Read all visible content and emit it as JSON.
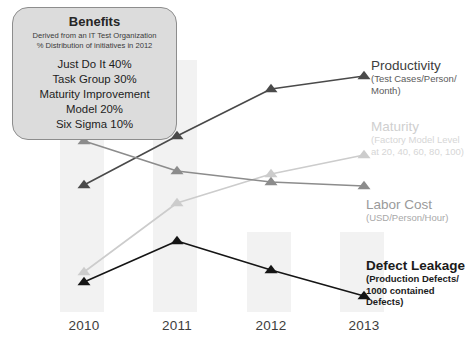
{
  "callout": {
    "title": "Benefits",
    "subtitle_line1": "Derived from an IT Test Organization",
    "subtitle_line2": "% Distribution of initiatives in 2012",
    "items": [
      "Just Do It 40%",
      "Task Group 30%",
      "Maturity Improvement",
      "Model 20%",
      "Six Sigma 10%"
    ]
  },
  "labels": {
    "productivity_title": "Productivity",
    "productivity_sub_1": "(Test Cases/Person/",
    "productivity_sub_2": "Month)",
    "maturity_title": "Maturity",
    "maturity_sub_1": "(Factory Model Level",
    "maturity_sub_2": "at 20, 40, 60, 80, 100)",
    "labor_title": "Labor Cost",
    "labor_sub_1": "(USD/Person/Hour)",
    "defect_title": "Defect Leakage",
    "defect_sub_1": "(Production Defects/",
    "defect_sub_2": "1000 contained",
    "defect_sub_3": "Defects)"
  },
  "colors": {
    "productivity": "#4a4a4a",
    "maturity": "#cccccc",
    "labor_cost": "#8c8c8c",
    "defect_leakage": "#151515",
    "band": "#f2f2f2",
    "callout_fill": "#dcdcdc",
    "callout_stroke": "#8d8d8d"
  },
  "chart_data": {
    "type": "line",
    "title": "Benefits",
    "xlabel": "",
    "ylabel": "",
    "grid": false,
    "legend": "inline-right-callouts",
    "categories": [
      "2010",
      "2011",
      "2012",
      "2013"
    ],
    "x_pixels": [
      84,
      177,
      271,
      364
    ],
    "ylim_pixels": [
      312,
      40
    ],
    "series": [
      {
        "name": "Productivity",
        "units": "(Test Cases/Person/Month)",
        "color": "#4a4a4a",
        "marker": "triangle",
        "y_pixels": [
          185,
          136,
          89,
          76
        ],
        "values": [
          2.0,
          3.3,
          4.5,
          4.8
        ],
        "trend": "increasing"
      },
      {
        "name": "Maturity",
        "units": "(Factory Model Level at 20, 40, 60, 80, 100)",
        "color": "#cccccc",
        "marker": "triangle",
        "y_pixels": [
          272,
          203,
          174,
          155
        ],
        "values": [
          20,
          60,
          75,
          85
        ],
        "trend": "increasing"
      },
      {
        "name": "Labor Cost",
        "units": "(USD/Person/Hour)",
        "color": "#8c8c8c",
        "marker": "triangle",
        "y_pixels": [
          141,
          171,
          182,
          186
        ],
        "values": [
          4.2,
          3.1,
          2.7,
          2.6
        ],
        "trend": "decreasing"
      },
      {
        "name": "Defect Leakage",
        "units": "(Production Defects/1000 contained Defects)",
        "color": "#151515",
        "marker": "triangle",
        "y_pixels": [
          282,
          241,
          270,
          296
        ],
        "values": [
          1.1,
          3.0,
          1.6,
          0.6
        ],
        "trend": "peak-2011-then-decreasing"
      }
    ],
    "bands": [
      {
        "label": "2010",
        "x": 60,
        "width": 44,
        "y": 60,
        "height": 252
      },
      {
        "label": "2011",
        "x": 153,
        "width": 44,
        "y": 60,
        "height": 252
      },
      {
        "label": "2012",
        "x": 247,
        "width": 44,
        "y": 232,
        "height": 80
      },
      {
        "label": "2013",
        "x": 340,
        "width": 44,
        "y": 232,
        "height": 80
      }
    ]
  }
}
